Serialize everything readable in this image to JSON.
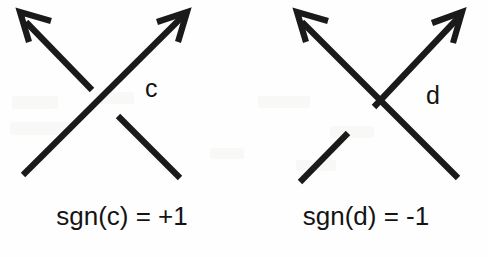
{
  "figure": {
    "background_color": "#fefefe",
    "ink_color": "#1a1a1a"
  },
  "panels": [
    {
      "id": "positive-crossing",
      "crossing_label": "c",
      "caption": "sgn(c) = +1",
      "sign": "+1",
      "over_strand": "southwest-to-northeast",
      "under_strand": "southeast-to-northwest"
    },
    {
      "id": "negative-crossing",
      "crossing_label": "d",
      "caption": "sgn(d) = -1",
      "sign": "-1",
      "over_strand": "southeast-to-northwest",
      "under_strand": "southwest-to-northeast"
    }
  ]
}
